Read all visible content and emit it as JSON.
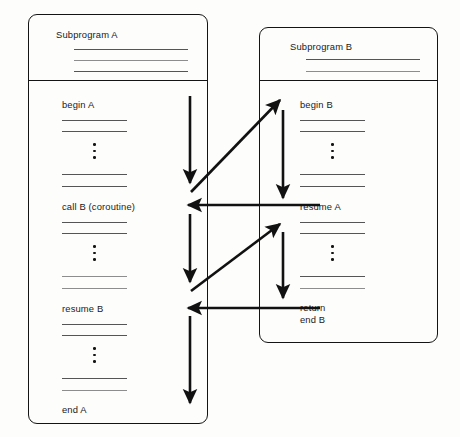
{
  "diagram": {
    "type": "flow-diagram",
    "background_color": "#fdfdfc",
    "line_color": "#141414",
    "rule_color": "#555555"
  },
  "boxes": [
    {
      "id": "subprogram-a",
      "header": "Subprogram A",
      "header_rule_count": 3,
      "x": 28,
      "y": 14,
      "width": 180,
      "height": 410,
      "divider_y": 80,
      "sections": [
        {
          "label": "begin A",
          "rules_before": 0,
          "rules_after": 2,
          "dots": true
        },
        {
          "label": "call B (coroutine)",
          "rules_before": 2,
          "rules_after": 2,
          "dots": true
        },
        {
          "label": "resume B",
          "rules_before": 2,
          "rules_after": 2,
          "dots": true
        },
        {
          "label": "end A",
          "rules_before": 2,
          "rules_after": 0,
          "dots": false
        }
      ]
    },
    {
      "id": "subprogram-b",
      "header": "Subprogram B",
      "header_rule_count": 2,
      "x": 259,
      "y": 27,
      "width": 179,
      "height": 316,
      "divider_y": 80,
      "sections": [
        {
          "label": "begin B",
          "rules_before": 0,
          "rules_after": 2,
          "dots": true
        },
        {
          "label": "resume A",
          "rules_before": 2,
          "rules_after": 2,
          "dots": true
        },
        {
          "label": "return\nend B",
          "rules_before": 2,
          "rules_after": 0,
          "dots": false
        }
      ]
    }
  ],
  "arrows": [
    {
      "name": "a-exec-1",
      "kind": "vertical-down",
      "x1": 190,
      "y1": 96,
      "x2": 190,
      "y2": 186
    },
    {
      "name": "call-b-transfer",
      "kind": "diagonal-up-right",
      "x1": 191,
      "y1": 192,
      "x2": 282,
      "y2": 99
    },
    {
      "name": "b-exec-1",
      "kind": "vertical-down",
      "x1": 283,
      "y1": 110,
      "x2": 283,
      "y2": 201
    },
    {
      "name": "resume-a-transfer-1",
      "kind": "horizontal-left",
      "x1": 320,
      "y1": 205,
      "x2": 185,
      "y2": 205
    },
    {
      "name": "a-exec-2",
      "kind": "vertical-down",
      "x1": 190,
      "y1": 214,
      "x2": 190,
      "y2": 285
    },
    {
      "name": "resume-b-transfer",
      "kind": "diagonal-up-right",
      "x1": 191,
      "y1": 291,
      "x2": 282,
      "y2": 223
    },
    {
      "name": "b-exec-2",
      "kind": "vertical-down",
      "x1": 283,
      "y1": 232,
      "x2": 283,
      "y2": 301
    },
    {
      "name": "return-transfer",
      "kind": "horizontal-left",
      "x1": 320,
      "y1": 308,
      "x2": 185,
      "y2": 308
    },
    {
      "name": "a-exec-3",
      "kind": "vertical-down",
      "x1": 190,
      "y1": 316,
      "x2": 190,
      "y2": 406
    }
  ]
}
